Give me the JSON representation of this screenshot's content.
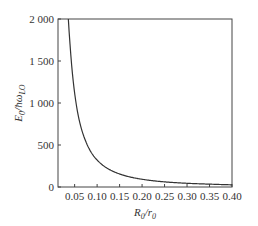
{
  "chart_data": {
    "type": "line",
    "title": "",
    "xlabel": "R_0/r_0",
    "ylabel": "E_0/ħω_LO",
    "xlim": [
      0.013,
      0.4
    ],
    "ylim": [
      0,
      2000
    ],
    "grid": false,
    "legend": null,
    "x_ticks": [
      "0.05",
      "0.10",
      "0.15",
      "0.20",
      "0.25",
      "0.30",
      "0.35",
      "0.40"
    ],
    "y_ticks": [
      "0",
      "500",
      "1 000",
      "1 500",
      "2 000"
    ],
    "series": [
      {
        "name": "E0",
        "x": [
          0.036,
          0.04,
          0.05,
          0.06,
          0.075,
          0.09,
          0.1,
          0.125,
          0.15,
          0.175,
          0.2,
          0.25,
          0.3,
          0.35,
          0.4
        ],
        "y": [
          2000,
          1680,
          1118,
          800,
          540,
          386,
          321,
          215,
          155,
          117,
          92,
          61,
          44,
          34,
          26
        ]
      }
    ]
  },
  "labels": {
    "x_main": "R",
    "x_sub": "0",
    "x_sep": "/r",
    "x_sub2": "0",
    "y_main": "E",
    "y_sub": "0",
    "y_sep": "/ħω",
    "y_sub2": "LO"
  }
}
